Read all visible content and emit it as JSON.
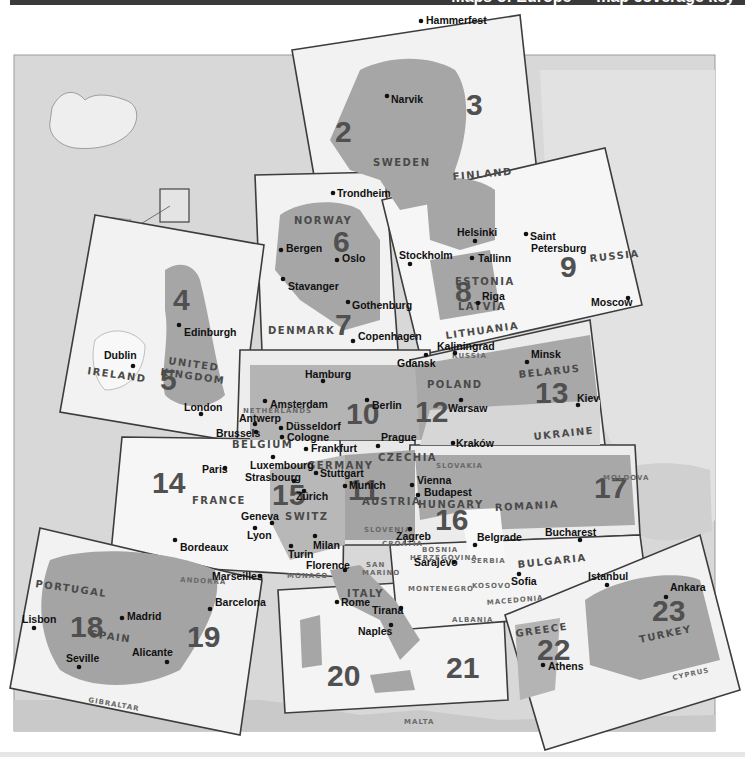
{
  "header": {
    "title": "Maps of Europe — map coverage key"
  },
  "map": {
    "background_sea_color": "#d6d6d6",
    "land_color": "#a9a9a9",
    "sheet_color": "#f0f0f0",
    "frame_color": "#3c3c3c",
    "sheets": [
      {
        "number": "2",
        "label": "Sheet 2"
      },
      {
        "number": "3",
        "label": "Sheet 3"
      },
      {
        "number": "4",
        "label": "Sheet 4"
      },
      {
        "number": "5",
        "label": "Sheet 5"
      },
      {
        "number": "6",
        "label": "Sheet 6"
      },
      {
        "number": "7",
        "label": "Sheet 7"
      },
      {
        "number": "8",
        "label": "Sheet 8"
      },
      {
        "number": "9",
        "label": "Sheet 9"
      },
      {
        "number": "10",
        "label": "Sheet 10"
      },
      {
        "number": "11",
        "label": "Sheet 11"
      },
      {
        "number": "12",
        "label": "Sheet 12"
      },
      {
        "number": "13",
        "label": "Sheet 13"
      },
      {
        "number": "14",
        "label": "Sheet 14"
      },
      {
        "number": "15",
        "label": "Sheet 15"
      },
      {
        "number": "16",
        "label": "Sheet 16"
      },
      {
        "number": "17",
        "label": "Sheet 17"
      },
      {
        "number": "18",
        "label": "Sheet 18"
      },
      {
        "number": "19",
        "label": "Sheet 19"
      },
      {
        "number": "20",
        "label": "Sheet 20"
      },
      {
        "number": "21",
        "label": "Sheet 21"
      },
      {
        "number": "22",
        "label": "Sheet 22"
      },
      {
        "number": "23",
        "label": "Sheet 23"
      }
    ],
    "countries": [
      "SWEDEN",
      "FINLAND",
      "NORWAY",
      "DENMARK",
      "ESTONIA",
      "LATVIA",
      "LITHUANIA",
      "RUSSIA",
      "UNITED",
      "KINGDOM",
      "IRELAND",
      "POLAND",
      "BELARUS",
      "UKRAINE",
      "NETHERLANDS",
      "BELGIUM",
      "GERMANY",
      "CZECHIA",
      "SLOVAKIA",
      "FRANCE",
      "SWITZ",
      "AUSTRIA",
      "HUNGARY",
      "ROMANIA",
      "MOLDOVA",
      "SLOVENIA",
      "CROATIA",
      "BOSNIA",
      "HERZEGOVINA",
      "SERBIA",
      "BULGARIA",
      "MONTENEGRO",
      "KOSOVO",
      "MACEDONIA",
      "ALBANIA",
      "SAN",
      "MARINO",
      "MONACO",
      "ANDORRA",
      "ITALY",
      "PORTUGAL",
      "SPAIN",
      "GIBRALTAR",
      "GREECE",
      "TURKEY",
      "CYPRUS",
      "MALTA",
      "RUSSIA"
    ],
    "cities": [
      "Hammerfest",
      "Narvik",
      "Trondheim",
      "Bergen",
      "Oslo",
      "Stavanger",
      "Gothenburg",
      "Copenhagen",
      "Stockholm",
      "Helsinki",
      "Tallinn",
      "Riga",
      "Saint",
      "Petersburg",
      "Moscow",
      "Edinburgh",
      "Dublin",
      "London",
      "Kaliningrad",
      "Minsk",
      "Hamburg",
      "Gdansk",
      "Amsterdam",
      "Berlin",
      "Antwerp",
      "Brussels",
      "Düsseldorf",
      "Cologne",
      "Warsaw",
      "Kiev",
      "Frankfurt",
      "Prague",
      "Kraków",
      "Paris",
      "Luxembourg",
      "Strasbourg",
      "Stuttgart",
      "Munich",
      "Vienna",
      "Zürich",
      "Budapest",
      "Geneva",
      "Lyon",
      "Zagreb",
      "Belgrade",
      "Bucharest",
      "Turin",
      "Milan",
      "Bordeaux",
      "Florence",
      "Sarajevo",
      "Marseilles",
      "Sofia",
      "Istanbul",
      "Ankara",
      "Madrid",
      "Barcelona",
      "Lisbon",
      "Rome",
      "Tirana",
      "Alicante",
      "Seville",
      "Naples",
      "Athens"
    ]
  }
}
